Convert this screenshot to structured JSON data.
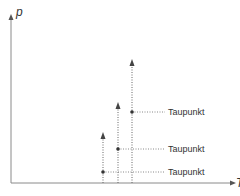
{
  "diagram": {
    "axes": {
      "y_label": "p",
      "x_label": "T"
    },
    "colors": {
      "axis": "#8a8a8a",
      "dotted": "#666666",
      "arrow": "#444444",
      "point": "#333333",
      "text": "#333333"
    },
    "arrows": [
      {
        "x": 103,
        "top": 133,
        "point_y": 172,
        "label": "Taupunkt"
      },
      {
        "x": 118,
        "top": 103,
        "point_y": 149,
        "label": "Taupunkt"
      },
      {
        "x": 132,
        "top": 60,
        "point_y": 112,
        "label": "Taupunkt"
      }
    ]
  }
}
